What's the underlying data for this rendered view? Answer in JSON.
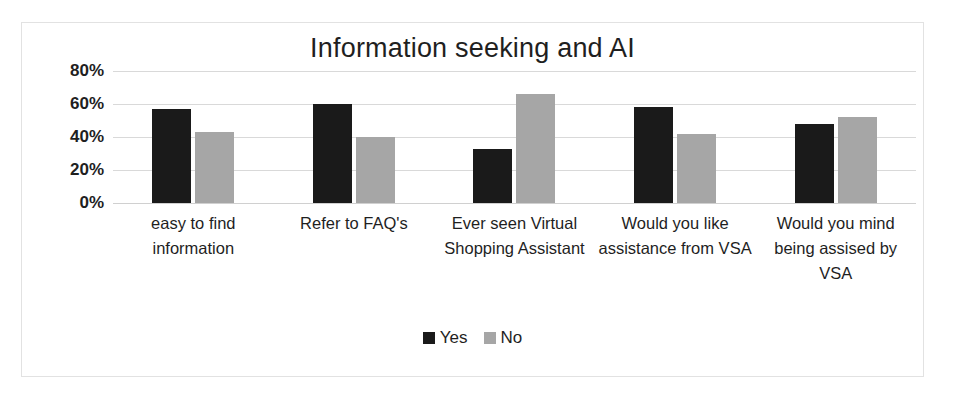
{
  "chart_data": {
    "type": "bar",
    "title": "Information seeking and AI",
    "xlabel": "",
    "ylabel": "",
    "ylim": [
      0,
      80
    ],
    "ytick_labels": [
      "80%",
      "60%",
      "40%",
      "20%",
      "0%"
    ],
    "ytick_values": [
      80,
      60,
      40,
      20,
      0
    ],
    "grid": true,
    "legend_position": "bottom-center",
    "categories": [
      "easy to find information",
      "Refer to FAQ's",
      "Ever seen Virtual Shopping Assistant",
      "Would you like assistance from VSA",
      "Would you mind being assised by VSA"
    ],
    "series": [
      {
        "name": "Yes",
        "color": "#1a1a1a",
        "values": [
          57,
          60,
          33,
          58,
          48
        ]
      },
      {
        "name": "No",
        "color": "#a6a6a6",
        "values": [
          43,
          40,
          66,
          42,
          52
        ]
      }
    ]
  },
  "legend": {
    "items": [
      {
        "label": "Yes",
        "swatch": "legend-swatch-black"
      },
      {
        "label": "No",
        "swatch": "legend-swatch-gray"
      }
    ]
  },
  "colors": {
    "yes": "#1a1a1a",
    "no": "#a6a6a6",
    "gridline": "#d9d9d9",
    "frame_border": "#e2e2e2",
    "text": "#1f1f1f",
    "background": "#ffffff"
  }
}
